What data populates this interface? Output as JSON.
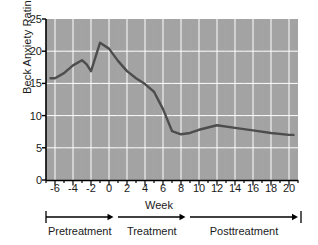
{
  "chart_data": {
    "type": "line",
    "title": "",
    "xlabel": "Week",
    "ylabel": "Beck Anxiety Rating",
    "xlim": [
      -7,
      21
    ],
    "ylim": [
      0,
      25
    ],
    "grid": true,
    "legend": "none",
    "plot_background": "#a3a3a3",
    "gridline_color": "#ffffff",
    "line_color": "#4d4d4d",
    "axis_color": "#000000",
    "yticks": [
      0,
      5,
      10,
      15,
      20,
      25
    ],
    "xticks": [
      -6,
      -4,
      -2,
      0,
      2,
      4,
      6,
      8,
      10,
      12,
      14,
      16,
      18,
      20
    ],
    "xtick_labels": [
      "-6",
      "-4",
      "-2",
      "0",
      "2",
      "4",
      "6",
      "8",
      "10",
      "12",
      "14",
      "16",
      "18",
      "20"
    ],
    "ytick_labels": [
      "0",
      "5",
      "10",
      "15",
      "20",
      "25"
    ],
    "x_minor_step": 1,
    "x": [
      -6.5,
      -6,
      -5,
      -4,
      -3,
      -2.5,
      -2,
      -1,
      0,
      1,
      2,
      3,
      4,
      5,
      6,
      7,
      8,
      9,
      10,
      12,
      14,
      16,
      18,
      20,
      20.5
    ],
    "values": [
      15.8,
      15.8,
      16.6,
      17.8,
      18.6,
      18.0,
      16.9,
      21.3,
      20.4,
      18.5,
      16.9,
      15.8,
      14.9,
      13.7,
      11.0,
      7.6,
      7.1,
      7.3,
      7.8,
      8.5,
      8.1,
      7.7,
      7.3,
      7.0,
      7.0
    ],
    "series": [
      {
        "name": "Beck Anxiety Rating",
        "values": [
          15.8,
          15.8,
          16.6,
          17.8,
          18.6,
          18.0,
          16.9,
          21.3,
          20.4,
          18.5,
          16.9,
          15.8,
          14.9,
          13.7,
          11.0,
          7.6,
          7.1,
          7.3,
          7.8,
          8.5,
          8.1,
          7.7,
          7.3,
          7.0,
          7.0
        ]
      }
    ],
    "annotations": [
      {
        "name": "pretreatment",
        "label": "Pretreatment",
        "start_week": -7,
        "end_week": 0.5
      },
      {
        "name": "treatment",
        "label": "Treatment",
        "start_week": 1,
        "end_week": 8.5
      },
      {
        "name": "posttreatment",
        "label": "Posttreatment",
        "start_week": 9,
        "end_week": 21
      }
    ]
  },
  "axis": {
    "xlabel": "Week",
    "ylabel": "Beck Anxiety Rating"
  },
  "phases": {
    "pretreatment": "Pretreatment",
    "treatment": "Treatment",
    "posttreatment": "Posttreatment"
  }
}
